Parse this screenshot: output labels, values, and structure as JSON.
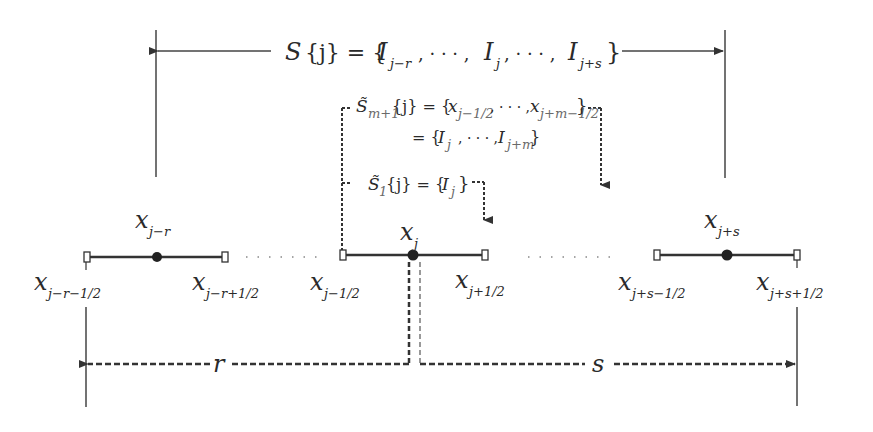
{
  "diagram": {
    "type": "stencil-illustration",
    "colors": {
      "line": "#333333",
      "background": "#ffffff"
    },
    "top_stencil": {
      "label_main": "S",
      "label_arg": "{j} = {",
      "items": [
        {
          "base": "I",
          "sub": "j−r"
        },
        {
          "base": "",
          "sub": "· · · ,"
        },
        {
          "base": "I",
          "sub": "j"
        },
        {
          "base": "",
          "sub": "· · · ,"
        },
        {
          "base": "I",
          "sub": "j+s"
        }
      ],
      "close": "}"
    },
    "middle_stencil": {
      "label": "S̃",
      "label_sub": "m+1",
      "arg": "{j} = {",
      "line1_items": [
        {
          "base": "x",
          "sub": "j−1/2"
        },
        {
          "base": "",
          "sub": "· · · ,"
        },
        {
          "base": "x",
          "sub": "j+m−1/2"
        }
      ],
      "line2_prefix": "= {",
      "line2_items": [
        {
          "base": "I",
          "sub": "j"
        },
        {
          "base": "",
          "sub": "· · · ,"
        },
        {
          "base": "I",
          "sub": "j+m"
        }
      ],
      "close": "}"
    },
    "small_stencil": {
      "label": "S̃",
      "label_sub": "1",
      "arg": "{j} = {",
      "item": {
        "base": "I",
        "sub": "j"
      },
      "close": "}"
    },
    "cells": [
      {
        "center_label": {
          "base": "x",
          "sub": "j−r"
        },
        "left_label": {
          "base": "x",
          "sub": "j−r−1/2"
        },
        "right_label": {
          "base": "x",
          "sub": "j−r+1/2"
        }
      },
      {
        "center_label": {
          "base": "x",
          "sub": "j"
        },
        "left_label": {
          "base": "x",
          "sub": "j−1/2"
        },
        "right_label": {
          "base": "x",
          "sub": "j+1/2"
        }
      },
      {
        "center_label": {
          "base": "x",
          "sub": "j+s"
        },
        "left_label": {
          "base": "x",
          "sub": "j+s−1/2"
        },
        "right_label": {
          "base": "x",
          "sub": "j+s+1/2"
        }
      }
    ],
    "bottom_labels": {
      "left": "r",
      "right": "s"
    }
  }
}
